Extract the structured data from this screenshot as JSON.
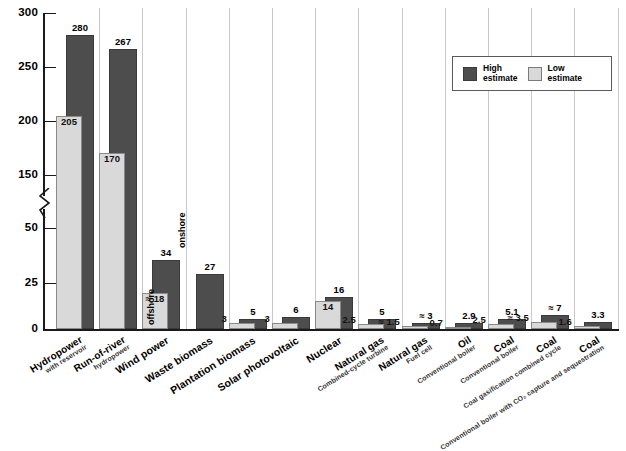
{
  "chart_data": {
    "type": "bar",
    "title": "",
    "xlabel": "",
    "ylabel": "",
    "ylim": [
      0,
      300
    ],
    "grid": false,
    "axis_break": {
      "from": 50,
      "to": 150,
      "present": true
    },
    "ytick_labels": [
      "0",
      "25",
      "50",
      "150",
      "200",
      "250",
      "300"
    ],
    "ytick_values": [
      0,
      25,
      50,
      150,
      200,
      250,
      300
    ],
    "legend": {
      "position": "top-right",
      "entries": [
        {
          "name": "High estimate",
          "line1": "High",
          "line2": "estimate",
          "color": "#4d4d4d"
        },
        {
          "name": "Low estimate",
          "line1": "Low",
          "line2": "estimate",
          "color": "#d9d9d9"
        }
      ]
    },
    "categories": [
      {
        "line1": "Hydropower",
        "line2": "with reservoir"
      },
      {
        "line1": "Run-of-river",
        "line2": "hydropower"
      },
      {
        "line1": "Wind power",
        "line2": ""
      },
      {
        "line1": "Waste biomass",
        "line2": ""
      },
      {
        "line1": "Plantation biomass",
        "line2": ""
      },
      {
        "line1": "Solar photovoltaic",
        "line2": ""
      },
      {
        "line1": "Nuclear",
        "line2": ""
      },
      {
        "line1": "Natural gas",
        "line2": "Combined-cycle turbine"
      },
      {
        "line1": "Natural gas",
        "line2": "Fuel cell"
      },
      {
        "line1": "Oil",
        "line2": "Conventional boiler"
      },
      {
        "line1": "Coal",
        "line2": "Conventional boiler"
      },
      {
        "line1": "Coal",
        "line2": "Coal gasification combined cycle"
      },
      {
        "line1": "Coal",
        "line2": "Conventional boiler with CO₂ capture and sequestration"
      }
    ],
    "series": [
      {
        "name": "High estimate",
        "color": "#4d4d4d",
        "values": [
          280,
          267,
          34,
          27,
          5,
          6,
          16,
          5,
          3,
          2.9,
          5.1,
          7,
          3.3
        ],
        "labels": [
          "280",
          "267",
          "34",
          "27",
          "5",
          "6",
          "16",
          "5",
          "≈ 3",
          "2.9",
          "5.1",
          "≈ 7",
          "3.3"
        ]
      },
      {
        "name": "Low estimate",
        "color": "#d9d9d9",
        "values": [
          205,
          170,
          18,
          null,
          3,
          3,
          14,
          2.5,
          1.5,
          0.7,
          2.5,
          3.5,
          1.6
        ],
        "labels": [
          "205",
          "170",
          "≈ 18",
          "",
          "3",
          "3",
          "14",
          "2.5",
          "≈ 1.5",
          "0.7",
          "2.5",
          "≈ 3.5",
          "1.6"
        ]
      }
    ],
    "annotations": [
      {
        "text": "onshore",
        "category": "Wind power",
        "series": "High estimate",
        "orientation": "vertical"
      },
      {
        "text": "offshore",
        "category": "Wind power",
        "series": "Low estimate",
        "orientation": "vertical"
      }
    ]
  }
}
